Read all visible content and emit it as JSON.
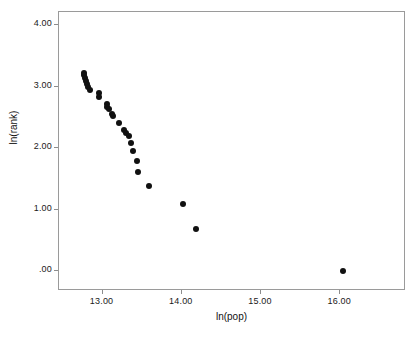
{
  "chart_data": {
    "type": "scatter",
    "title": "",
    "subtitle": "",
    "xlabel": "ln(pop)",
    "ylabel": "ln(rank)",
    "xlim": [
      12.45,
      16.83
    ],
    "ylim": [
      -0.32,
      4.21
    ],
    "grid": false,
    "legend": null,
    "x_ticks": [
      13.0,
      14.0,
      15.0,
      16.0
    ],
    "x_tick_labels": [
      "13.00",
      "14.00",
      "15.00",
      "16.00"
    ],
    "y_ticks": [
      0.0,
      1.0,
      2.0,
      3.0,
      4.0
    ],
    "y_tick_labels": [
      ".00",
      "1.00",
      "2.00",
      "3.00",
      "4.00"
    ],
    "marker": "filled-circle",
    "marker_color": "#111111",
    "marker_size_px": 6,
    "frame_color": "#9a9a9a",
    "background_color": "#ffffff",
    "series": [
      {
        "name": "cities",
        "points": [
          [
            12.76,
            3.22
          ],
          [
            12.77,
            3.18
          ],
          [
            12.78,
            3.14
          ],
          [
            12.79,
            3.09
          ],
          [
            12.8,
            3.04
          ],
          [
            12.82,
            3.0
          ],
          [
            12.84,
            2.94
          ],
          [
            12.95,
            2.89
          ],
          [
            12.96,
            2.83
          ],
          [
            13.05,
            2.71
          ],
          [
            13.06,
            2.67
          ],
          [
            13.08,
            2.64
          ],
          [
            13.12,
            2.56
          ],
          [
            13.13,
            2.52
          ],
          [
            13.21,
            2.4
          ],
          [
            13.27,
            2.3
          ],
          [
            13.29,
            2.25
          ],
          [
            13.33,
            2.2
          ],
          [
            13.36,
            2.08
          ],
          [
            13.39,
            1.95
          ],
          [
            13.43,
            1.79
          ],
          [
            13.45,
            1.61
          ],
          [
            13.58,
            1.39
          ],
          [
            14.02,
            1.1
          ],
          [
            14.18,
            0.69
          ],
          [
            16.04,
            0.0
          ]
        ]
      }
    ]
  },
  "axes": {
    "x": {
      "label": "ln(pop)",
      "ticks": [
        {
          "value": 13.0,
          "label": "13.00"
        },
        {
          "value": 14.0,
          "label": "14.00"
        },
        {
          "value": 15.0,
          "label": "15.00"
        },
        {
          "value": 16.0,
          "label": "16.00"
        }
      ]
    },
    "y": {
      "label": "ln(rank)",
      "ticks": [
        {
          "value": 4.0,
          "label": "4.00"
        },
        {
          "value": 3.0,
          "label": "3.00"
        },
        {
          "value": 2.0,
          "label": "2.00"
        },
        {
          "value": 1.0,
          "label": "1.00"
        },
        {
          "value": 0.0,
          "label": ".00"
        }
      ]
    }
  }
}
